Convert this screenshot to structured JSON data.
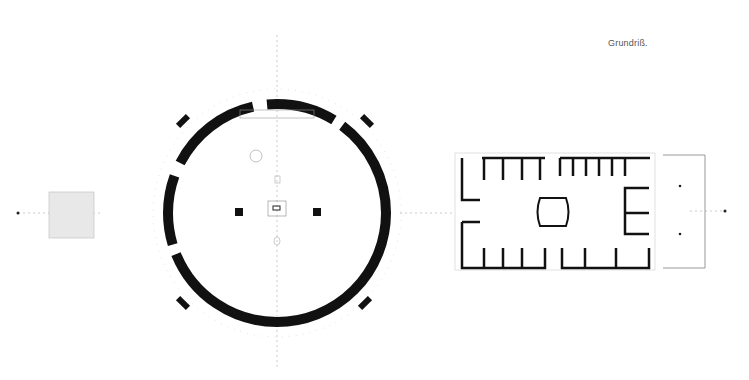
{
  "drawing": {
    "title": "Grundriß.",
    "type": "architectural floor plan",
    "colors": {
      "wall": "#111111",
      "thin_line": "#999999",
      "light_fill": "#e6e6e6",
      "background": "#ffffff"
    },
    "elements": [
      {
        "name": "small-square-outbuilding",
        "shape": "square",
        "position": "left"
      },
      {
        "name": "circular-building",
        "shape": "ring",
        "position": "center-left"
      },
      {
        "name": "rectangular-building",
        "shape": "rectangle",
        "position": "right"
      },
      {
        "name": "open-courtyard",
        "shape": "rectangle-outline",
        "position": "far-right"
      }
    ]
  }
}
